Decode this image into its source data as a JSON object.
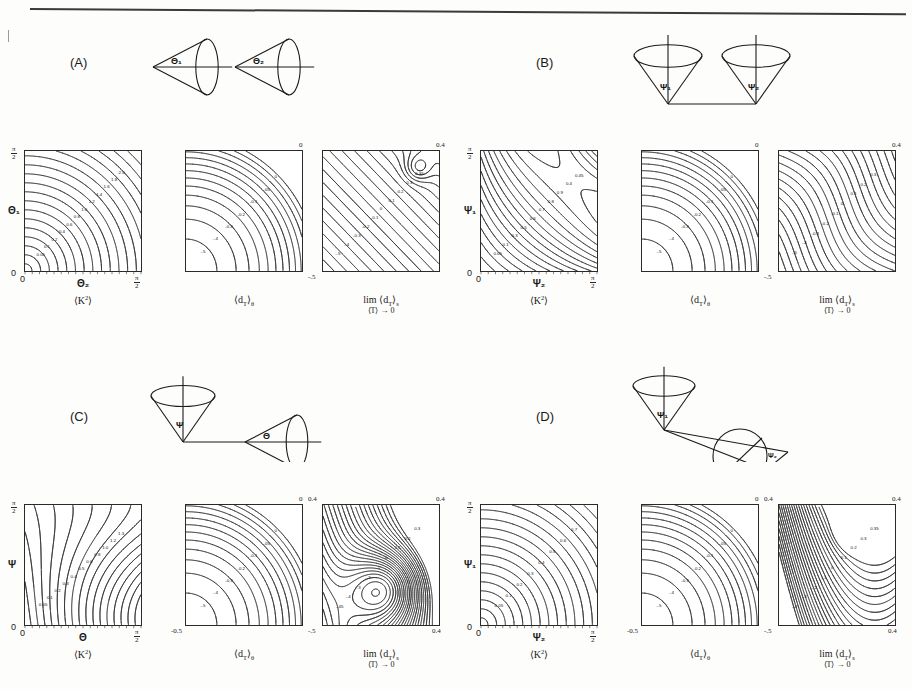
{
  "figure": {
    "type": "contour-plot-grid",
    "panel_count": 4,
    "plots_per_panel": 3,
    "captions": {
      "left": "⟨K²⟩",
      "middle": "⟨d_T⟩θ",
      "right": "lim ⟨d_T⟩s",
      "right_sub": "⟨T⟩ → 0"
    }
  },
  "panels": [
    {
      "id": "A",
      "letter": "(A)",
      "diagram": {
        "name": "two-horizontal-cones",
        "angles": [
          "Θ₁",
          "Θ₂"
        ]
      },
      "axes": {
        "y": "Θ₁",
        "x": "Θ₂",
        "ymax": "π/2",
        "xmax": "π/2",
        "origin": "0"
      },
      "plots": [
        {
          "caption": "⟨K²⟩",
          "pattern": "concentric-quarter-arcs",
          "corner_labels": [],
          "contour_labels": [
            "0.05",
            "0.1",
            "0.2",
            "0.4",
            "0.6",
            "0.8",
            "1.0",
            "1.2",
            "1.4",
            "1.6",
            "1.8",
            "2.0"
          ]
        },
        {
          "caption": "⟨d_T⟩θ",
          "pattern": "negative-corner-arcs",
          "corner_labels": [
            "0"
          ],
          "contour_labels": [
            "-.5",
            "-.4",
            "-0.3",
            "-0.2",
            "-0.1",
            "-.05",
            "0"
          ]
        },
        {
          "caption": "lim ⟨d_T⟩s",
          "caption_sub": "⟨T⟩ → 0",
          "pattern": "diagonal-with-closed-maximum",
          "corner_labels": [
            "0.4",
            "-.5"
          ],
          "contour_labels": [
            "-.5",
            "-.4",
            "-0.3",
            "-0.2",
            "-0.1",
            "0",
            "0.1",
            "0.2",
            "0.3",
            "0.35"
          ]
        }
      ]
    },
    {
      "id": "B",
      "letter": "(B)",
      "diagram": {
        "name": "two-downward-cones",
        "angles": [
          "Ψ₁",
          "Ψ₂"
        ]
      },
      "axes": {
        "y": "Ψ₁",
        "x": "Ψ₂",
        "ymax": "π/2",
        "xmax": "π/2",
        "origin": "0"
      },
      "plots": [
        {
          "caption": "⟨K²⟩",
          "pattern": "saddle",
          "corner_labels": [],
          "contour_labels": [
            "0.05",
            "0.1",
            "0.3",
            "0.5",
            "0.6",
            "0.7",
            "0.8",
            "0.9",
            "0.4",
            "0.45"
          ]
        },
        {
          "caption": "⟨d_T⟩θ",
          "pattern": "negative-corner-arcs",
          "corner_labels": [
            "0"
          ],
          "contour_labels": [
            "-.5",
            "-.4",
            "-0.3",
            "-0.2",
            "-0.1",
            "-.05",
            "0"
          ]
        },
        {
          "caption": "lim ⟨d_T⟩s",
          "caption_sub": "⟨T⟩ → 0",
          "pattern": "diagonal-bands",
          "corner_labels": [
            "0.4",
            "-.5"
          ],
          "contour_labels": [
            "-.5",
            "-.4",
            "-0.3",
            "-0.2",
            "-0.1",
            "0",
            "0.1",
            "0.2",
            "0.3"
          ]
        }
      ]
    },
    {
      "id": "C",
      "letter": "(C)",
      "diagram": {
        "name": "downward-cone-and-horizontal-cone",
        "angles": [
          "Ψ",
          "Θ"
        ]
      },
      "axes": {
        "y": "Ψ",
        "x": "Θ",
        "ymax": "π/2",
        "xmax": "π/2",
        "origin": "0"
      },
      "plots": [
        {
          "caption": "⟨K²⟩",
          "pattern": "horizontal-sweep",
          "corner_labels": [],
          "contour_labels": [
            "0.05",
            "0.1",
            "0.2",
            "0.3",
            "0.4",
            "0.5",
            "0.6",
            "0.8",
            "1.0",
            "1.2",
            "1.3"
          ]
        },
        {
          "caption": "⟨d_T⟩θ",
          "pattern": "negative-corner-arcs",
          "corner_labels": [
            "0",
            "-0.5"
          ],
          "contour_labels": [
            "-.5",
            "-.4",
            "-0.3",
            "-0.2",
            "-0.1",
            "-.05",
            "0"
          ]
        },
        {
          "caption": "lim ⟨d_T⟩s",
          "caption_sub": "⟨T⟩ → 0",
          "pattern": "s-curve-fan",
          "corner_labels": [
            "0.4",
            "0.4",
            "-.5",
            "0.4"
          ],
          "contour_labels": [
            "-.45",
            "-.4",
            "-.3",
            "-.2",
            "-.1",
            "0",
            "0.1",
            "0.2",
            "0.3"
          ]
        }
      ]
    },
    {
      "id": "D",
      "letter": "(D)",
      "diagram": {
        "name": "downward-cone-and-sphere",
        "angles": [
          "Ψ₁",
          "Ψ₂"
        ]
      },
      "axes": {
        "y": "Ψ₁",
        "x": "Ψ₂",
        "ymax": "π/2",
        "xmax": "π/2",
        "origin": "0"
      },
      "plots": [
        {
          "caption": "⟨K²⟩",
          "pattern": "concentric-quarter-arcs",
          "corner_labels": [],
          "contour_labels": [
            "0.05",
            "0.1",
            "0.2",
            "0.3",
            "0.4",
            "0.5",
            "0.6",
            "0.7"
          ]
        },
        {
          "caption": "⟨d_T⟩θ",
          "pattern": "negative-corner-arcs",
          "corner_labels": [
            "0",
            "-0.5"
          ],
          "contour_labels": [
            "-.5",
            "-.4",
            "-0.3",
            "-0.2",
            "-0.1",
            "-.05",
            "0"
          ]
        },
        {
          "caption": "lim ⟨d_T⟩s",
          "caption_sub": "⟨T⟩ → 0",
          "pattern": "saddle-with-island",
          "corner_labels": [
            "0.4",
            "0.4",
            "-.5",
            "0.4"
          ],
          "contour_labels": [
            "-.4",
            "-.3",
            "-.2",
            "-.1",
            "0",
            "0.1",
            "0.2",
            "0.3",
            "0.35"
          ]
        }
      ]
    }
  ]
}
